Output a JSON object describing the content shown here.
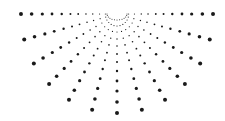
{
  "graphic": {
    "name": "radial-dot-half-sunburst",
    "center": [
      117,
      14
    ],
    "dot_color": "#1a1a1a",
    "background": "#ffffff",
    "rays": {
      "count": 13,
      "start_angle_deg": 0,
      "end_angle_deg": 180,
      "direction": "downward"
    },
    "inner_arc": {
      "radius": 10,
      "dot_count": 13
    },
    "dots_per_ray": [
      {
        "r": 12,
        "size": 0.55
      },
      {
        "r": 18,
        "size": 0.6
      },
      {
        "r": 25,
        "size": 0.7
      },
      {
        "r": 32,
        "size": 0.8
      },
      {
        "r": 40,
        "size": 0.9
      },
      {
        "r": 48,
        "size": 1.0
      },
      {
        "r": 57,
        "size": 1.2
      },
      {
        "r": 67,
        "size": 1.4
      },
      {
        "r": 77,
        "size": 1.6
      },
      {
        "r": 88,
        "size": 1.8
      },
      {
        "r": 99,
        "size": 2.0
      }
    ]
  }
}
